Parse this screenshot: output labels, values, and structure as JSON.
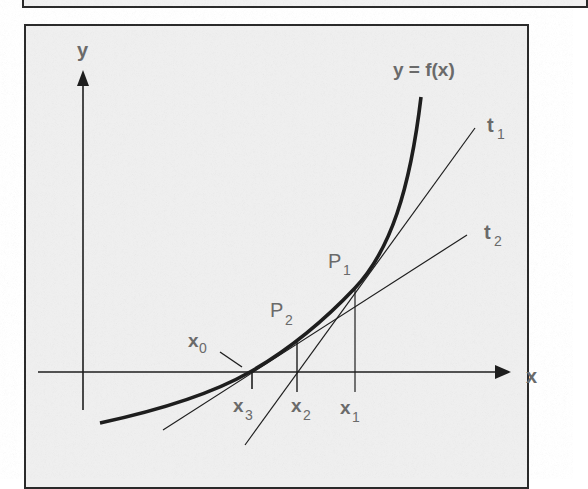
{
  "diagram": {
    "colors": {
      "ink": "#1e1e1e",
      "label": "#6a6a6a",
      "background": "#efefef",
      "border": "#2a2a2a"
    },
    "axes": {
      "x_label": "x",
      "y_label": "y"
    },
    "curve": {
      "label": "y = f(x)"
    },
    "tangents": [
      {
        "name": "t",
        "sub": "1"
      },
      {
        "name": "t",
        "sub": "2"
      }
    ],
    "points": [
      {
        "name": "P",
        "sub": "1"
      },
      {
        "name": "P",
        "sub": "2"
      }
    ],
    "x_marks": [
      {
        "name": "x",
        "sub": "0"
      },
      {
        "name": "x",
        "sub": "1"
      },
      {
        "name": "x",
        "sub": "2"
      },
      {
        "name": "x",
        "sub": "3"
      }
    ]
  }
}
